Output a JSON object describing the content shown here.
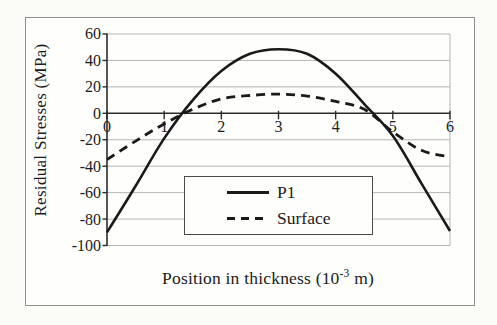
{
  "figure": {
    "y_axis_title": "Residual Stresses (MPa)",
    "x_axis_title": {
      "prefix": "Position in thickness (10",
      "superscript": "-3",
      "suffix": " m)"
    },
    "legend": {
      "items": [
        {
          "label": "P1",
          "style": "solid"
        },
        {
          "label": "Surface",
          "style": "dashed"
        }
      ]
    },
    "colors": {
      "line": "#1a1a1a",
      "grid": "#b5b5b2",
      "axis": "#2c2c2a",
      "text": "#1c1c1c",
      "background": "#fefefc",
      "border": "#8f8f8c"
    }
  },
  "chart_data": {
    "type": "line",
    "title": "",
    "xlabel": "Position in thickness (10^-3 m)",
    "ylabel": "Residual Stresses (MPa)",
    "xlim": [
      0,
      6
    ],
    "ylim": [
      -100,
      60
    ],
    "x_ticks": [
      0,
      1,
      2,
      3,
      4,
      5,
      6
    ],
    "y_ticks": [
      60,
      40,
      20,
      0,
      -20,
      -40,
      -60,
      -80,
      -100
    ],
    "grid": "horizontal",
    "legend_position": "inside-bottom-center",
    "series": [
      {
        "name": "P1",
        "style": "solid",
        "x": [
          0,
          0.5,
          1,
          1.5,
          2,
          2.5,
          3,
          3.5,
          4,
          4.5,
          5,
          5.5,
          6
        ],
        "y": [
          -90,
          -55,
          -19,
          10,
          32,
          45,
          48.5,
          45,
          30,
          7,
          -17,
          -53,
          -89
        ]
      },
      {
        "name": "Surface",
        "style": "dashed",
        "x": [
          0,
          0.5,
          1,
          1.5,
          2,
          2.5,
          3,
          3.5,
          4,
          4.5,
          5,
          5.5,
          6
        ],
        "y": [
          -35,
          -21,
          -8,
          3,
          11,
          13.5,
          14.5,
          13,
          9,
          3,
          -14,
          -28,
          -33
        ]
      }
    ]
  }
}
